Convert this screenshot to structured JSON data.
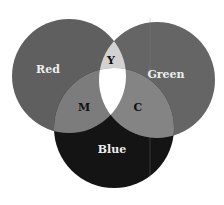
{
  "diagram": {
    "type": "venn",
    "title": "",
    "circles": [
      {
        "id": "red",
        "label": "Red",
        "fill": "#5f5f5f"
      },
      {
        "id": "green",
        "label": "Green",
        "fill": "#656565"
      },
      {
        "id": "blue",
        "label": "Blue",
        "fill": "#141414"
      }
    ],
    "intersections": [
      {
        "id": "yellow",
        "sets": [
          "red",
          "green"
        ],
        "label": "Y",
        "fill": "#d2d2d2"
      },
      {
        "id": "magenta",
        "sets": [
          "red",
          "blue"
        ],
        "label": "M",
        "fill": "#7c7c7c"
      },
      {
        "id": "cyan",
        "sets": [
          "green",
          "blue"
        ],
        "label": "C",
        "fill": "#848484"
      },
      {
        "id": "white",
        "sets": [
          "red",
          "green",
          "blue"
        ],
        "label": "",
        "fill": "#ffffff"
      }
    ]
  }
}
